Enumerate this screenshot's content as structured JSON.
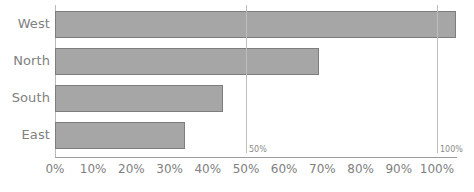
{
  "chart_data": {
    "type": "bar",
    "orientation": "horizontal",
    "title": "",
    "xlabel": "",
    "ylabel": "",
    "categories": [
      "West",
      "North",
      "South",
      "East"
    ],
    "values": [
      105,
      69,
      44,
      34
    ],
    "value_unit": "%",
    "xlim": [
      0,
      110
    ],
    "axis_ticks": [
      "0%",
      "10%",
      "20%",
      "30%",
      "40%",
      "50%",
      "60%",
      "70%",
      "80%",
      "90%",
      "100%"
    ],
    "axis_tick_values": [
      0,
      10,
      20,
      30,
      40,
      50,
      60,
      70,
      80,
      90,
      100
    ],
    "grid": false,
    "legend": "none",
    "reference_lines": [
      {
        "label": "50%",
        "value": 50
      },
      {
        "label": "100%",
        "value": 100
      }
    ],
    "series": [
      {
        "name": "Value",
        "values": [
          105,
          69,
          44,
          34
        ]
      }
    ],
    "colors": {
      "bar_fill": "#a6a6a6",
      "bar_border": "#7d7d7d",
      "text": "#808080",
      "axis": "#b9b9b9",
      "reference_line": "#bdbdbd",
      "background": "#ffffff"
    }
  }
}
